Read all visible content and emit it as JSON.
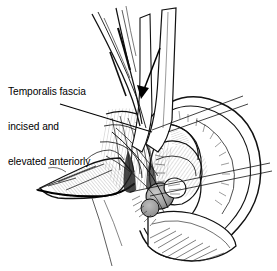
{
  "figure": {
    "domain": "medical-surgical-illustration",
    "title": "Temporalis fascia incised and elevated anteriorly",
    "background_color": "#ffffff",
    "ink_color": "#000000",
    "shading_color": "#9a9a9a",
    "width": 277,
    "height": 271
  },
  "annotation": {
    "line1": "Temporalis fascia",
    "line2": "incised and",
    "line3": "elevated anteriorly"
  },
  "labels": {
    "leader_line": "leader-line-from-caption-to-fascia",
    "direction_arrow": "retraction-arrow-pointing-inferiorly"
  },
  "anatomy": {
    "parts": [
      "auricle-pinna",
      "helix",
      "antihelix",
      "concha",
      "tragus",
      "lobule",
      "temporalis-fascia-flap",
      "superficial-temporal-vessels",
      "soft-tissue-flap",
      "retractor-blades"
    ]
  }
}
